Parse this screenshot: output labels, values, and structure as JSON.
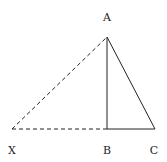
{
  "diagram": {
    "type": "geometry-triangle",
    "points": {
      "A": {
        "label": "A",
        "x": 107,
        "y": 37,
        "label_x": 107,
        "label_y": 21
      },
      "B": {
        "label": "B",
        "x": 107,
        "y": 129,
        "label_x": 107,
        "label_y": 154
      },
      "C": {
        "label": "C",
        "x": 155,
        "y": 129,
        "label_x": 154,
        "label_y": 154
      },
      "X": {
        "label": "X",
        "x": 12,
        "y": 129,
        "label_x": 12,
        "label_y": 154
      }
    },
    "segments": [
      {
        "from": "A",
        "to": "B",
        "style": "solid"
      },
      {
        "from": "B",
        "to": "C",
        "style": "solid"
      },
      {
        "from": "A",
        "to": "C",
        "style": "solid"
      },
      {
        "from": "X",
        "to": "A",
        "style": "dashed"
      },
      {
        "from": "X",
        "to": "B",
        "style": "dashed"
      }
    ],
    "stroke_color": "#222222"
  }
}
